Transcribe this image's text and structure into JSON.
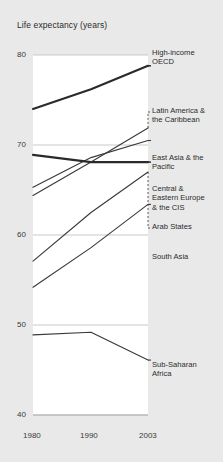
{
  "chart_data": {
    "type": "line",
    "title": "Life expectancy (years)",
    "xlabel": "",
    "ylabel": "Life expectancy (years)",
    "x": [
      1980,
      1990,
      2003
    ],
    "xtick_labels": [
      "1980",
      "1990",
      "2003"
    ],
    "ytick_labels": [
      "80",
      "70",
      "60",
      "50",
      "40"
    ],
    "yticks": [
      80,
      70,
      60,
      50,
      40
    ],
    "ylim": [
      40,
      80
    ],
    "grid": "horizontal",
    "legend": "right-inline-labels",
    "series": [
      {
        "name": "High-income OECD",
        "label": "High-income\nOECD",
        "values": [
          74.0,
          76.2,
          78.8
        ],
        "style": "thick",
        "leader": "none"
      },
      {
        "name": "Latin America & the Caribbean",
        "label": "Latin America &\nthe Caribbean",
        "values": [
          64.4,
          68.1,
          71.9
        ],
        "style": "thin",
        "leader": "dashed-vertical"
      },
      {
        "name": "East Asia & the Pacific",
        "label": "East Asia & the\nPacific",
        "values": [
          65.3,
          68.6,
          70.5
        ],
        "style": "thin",
        "leader": "none"
      },
      {
        "name": "Central & Eastern Europe & the CIS",
        "label": "Central &\nEastern Europe\n& the CIS",
        "values": [
          68.9,
          68.1,
          68.1
        ],
        "style": "thick",
        "leader": "none"
      },
      {
        "name": "Arab States",
        "label": "Arab States",
        "values": [
          57.1,
          62.5,
          67.0
        ],
        "style": "thin",
        "leader": "dashed-vertical"
      },
      {
        "name": "South Asia",
        "label": "South Asia",
        "values": [
          54.2,
          58.6,
          63.4
        ],
        "style": "thin",
        "leader": "none"
      },
      {
        "name": "Sub-Saharan Africa",
        "label": "Sub-Saharan\nAfrica",
        "values": [
          48.9,
          49.2,
          46.1
        ],
        "style": "thin",
        "leader": "none"
      }
    ]
  },
  "colors": {
    "background": "#e9e9e9",
    "plot_background": "#ffffff",
    "gridline": "#c9c9c9",
    "line": "#3a3a3a",
    "line_thick": "#2a2a2a",
    "text": "#2b2b2b"
  }
}
